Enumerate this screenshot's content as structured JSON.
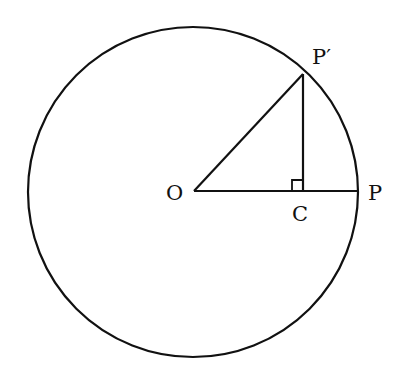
{
  "diagram": {
    "type": "geometry",
    "colors": {
      "stroke": "#111111",
      "background": "#ffffff"
    },
    "circle": {
      "center": "O",
      "cx": 193,
      "cy": 192,
      "r": 165
    },
    "points": {
      "O": {
        "label": "O",
        "x": 194,
        "y": 191
      },
      "P": {
        "label": "P",
        "x": 357,
        "y": 191
      },
      "P_prime": {
        "label": "P′",
        "x": 303,
        "y": 74
      },
      "C": {
        "label": "C",
        "x": 303,
        "y": 191
      }
    },
    "segments": [
      {
        "from": "O",
        "to": "P"
      },
      {
        "from": "O",
        "to": "P′"
      },
      {
        "from": "P′",
        "to": "C"
      }
    ],
    "right_angle_at": "C"
  }
}
